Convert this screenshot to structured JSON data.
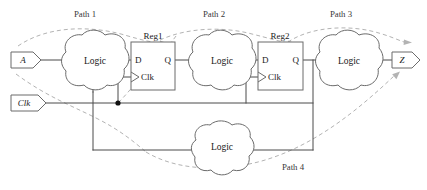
{
  "diagram": {
    "type": "digital-circuit-schematic",
    "width": 427,
    "height": 190,
    "colors": {
      "wire": "#4a4a4a",
      "outline": "#6b6b6b",
      "dashed_path": "#b3b3b3",
      "text": "#1a1a1a",
      "background": "#ffffff"
    }
  },
  "terminals": [
    {
      "id": "in-a",
      "label": "A",
      "kind": "input",
      "x": 25,
      "y": 60
    },
    {
      "id": "in-clk",
      "label": "Clk",
      "kind": "input",
      "x": 27,
      "y": 103
    },
    {
      "id": "out-z",
      "label": "Z",
      "kind": "output",
      "x": 404,
      "y": 60
    }
  ],
  "logic_blocks": [
    {
      "id": "logic-1",
      "label": "Logic",
      "cx": 95,
      "cy": 61
    },
    {
      "id": "logic-2",
      "label": "Logic",
      "cx": 222,
      "cy": 61
    },
    {
      "id": "logic-3",
      "label": "Logic",
      "cx": 349,
      "cy": 61
    },
    {
      "id": "logic-4",
      "label": "Logic",
      "cx": 222,
      "cy": 147
    }
  ],
  "registers": [
    {
      "id": "reg1",
      "label": "Reg1",
      "x": 131,
      "y": 42,
      "w": 44,
      "h": 48,
      "pins": {
        "d": "D",
        "q": "Q",
        "clk": "Clk"
      }
    },
    {
      "id": "reg2",
      "label": "Reg2",
      "x": 258,
      "y": 42,
      "w": 45,
      "h": 48,
      "pins": {
        "d": "D",
        "q": "Q",
        "clk": "Clk"
      }
    }
  ],
  "paths": [
    {
      "id": "path-1",
      "label": "Path 1",
      "x": 85,
      "y": 14,
      "desc": "A through Logic to Reg1 D input"
    },
    {
      "id": "path-2",
      "label": "Path 2",
      "x": 214,
      "y": 14,
      "desc": "Reg1 Q through Logic to Reg2 D input"
    },
    {
      "id": "path-3",
      "label": "Path 3",
      "x": 341,
      "y": 14,
      "desc": "Reg2 Q through Logic to output Z"
    },
    {
      "id": "path-4",
      "label": "Path 4",
      "x": 293,
      "y": 167,
      "desc": "Feedback through bottom Logic to first Logic"
    }
  ],
  "nets": {
    "clk_junction": {
      "x": 118,
      "y": 103
    },
    "clk_label": "Clk",
    "feedback_label": ""
  }
}
